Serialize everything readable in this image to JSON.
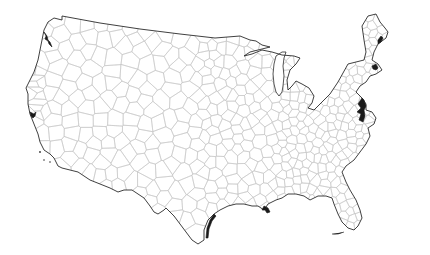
{
  "map": {
    "title": "Contiguous United States Voronoi tessellation",
    "colors": {
      "background": "#ffffff",
      "land": "#ffffff",
      "cell_edge": "#c4c4c4",
      "outline": "#2a2a2a"
    },
    "outline": [
      [
        54,
        18
      ],
      [
        62,
        20
      ],
      [
        62,
        16
      ],
      [
        100,
        23
      ],
      [
        140,
        29
      ],
      [
        180,
        34
      ],
      [
        215,
        38
      ],
      [
        240,
        36
      ],
      [
        250,
        40
      ],
      [
        256,
        41
      ],
      [
        262,
        45
      ],
      [
        270,
        47
      ],
      [
        250,
        52
      ],
      [
        244,
        56
      ],
      [
        252,
        54
      ],
      [
        262,
        50
      ],
      [
        272,
        52
      ],
      [
        282,
        55
      ],
      [
        294,
        56
      ],
      [
        300,
        58
      ],
      [
        296,
        64
      ],
      [
        290,
        70
      ],
      [
        287,
        80
      ],
      [
        288,
        90
      ],
      [
        292,
        86
      ],
      [
        296,
        81
      ],
      [
        302,
        84
      ],
      [
        309,
        88
      ],
      [
        314,
        96
      ],
      [
        312,
        103
      ],
      [
        308,
        108
      ],
      [
        314,
        110
      ],
      [
        320,
        104
      ],
      [
        330,
        94
      ],
      [
        338,
        82
      ],
      [
        348,
        64
      ],
      [
        356,
        62
      ],
      [
        364,
        60
      ],
      [
        366,
        52
      ],
      [
        364,
        40
      ],
      [
        362,
        26
      ],
      [
        368,
        16
      ],
      [
        376,
        14
      ],
      [
        380,
        22
      ],
      [
        385,
        28
      ],
      [
        388,
        32
      ],
      [
        386,
        38
      ],
      [
        378,
        44
      ],
      [
        374,
        52
      ],
      [
        372,
        60
      ],
      [
        378,
        64
      ],
      [
        382,
        70
      ],
      [
        376,
        74
      ],
      [
        370,
        76
      ],
      [
        366,
        82
      ],
      [
        360,
        86
      ],
      [
        356,
        92
      ],
      [
        362,
        98
      ],
      [
        366,
        104
      ],
      [
        366,
        110
      ],
      [
        372,
        112
      ],
      [
        376,
        118
      ],
      [
        374,
        124
      ],
      [
        368,
        128
      ],
      [
        370,
        136
      ],
      [
        366,
        144
      ],
      [
        360,
        152
      ],
      [
        354,
        160
      ],
      [
        346,
        166
      ],
      [
        342,
        172
      ],
      [
        346,
        182
      ],
      [
        350,
        190
      ],
      [
        356,
        200
      ],
      [
        360,
        210
      ],
      [
        362,
        218
      ],
      [
        358,
        226
      ],
      [
        354,
        230
      ],
      [
        348,
        228
      ],
      [
        342,
        222
      ],
      [
        338,
        214
      ],
      [
        334,
        204
      ],
      [
        332,
        198
      ],
      [
        326,
        196
      ],
      [
        318,
        196
      ],
      [
        310,
        200
      ],
      [
        304,
        196
      ],
      [
        296,
        194
      ],
      [
        288,
        194
      ],
      [
        282,
        198
      ],
      [
        276,
        200
      ],
      [
        268,
        204
      ],
      [
        264,
        210
      ],
      [
        258,
        206
      ],
      [
        252,
        206
      ],
      [
        244,
        204
      ],
      [
        236,
        204
      ],
      [
        228,
        206
      ],
      [
        220,
        210
      ],
      [
        214,
        214
      ],
      [
        208,
        220
      ],
      [
        204,
        230
      ],
      [
        204,
        240
      ],
      [
        198,
        244
      ],
      [
        192,
        240
      ],
      [
        186,
        232
      ],
      [
        180,
        224
      ],
      [
        174,
        216
      ],
      [
        170,
        212
      ],
      [
        166,
        208
      ],
      [
        164,
        210
      ],
      [
        158,
        214
      ],
      [
        154,
        212
      ],
      [
        150,
        206
      ],
      [
        144,
        198
      ],
      [
        138,
        194
      ],
      [
        132,
        190
      ],
      [
        124,
        190
      ],
      [
        118,
        192
      ],
      [
        110,
        188
      ],
      [
        100,
        184
      ],
      [
        90,
        180
      ],
      [
        78,
        172
      ],
      [
        70,
        170
      ],
      [
        62,
        168
      ],
      [
        58,
        166
      ],
      [
        54,
        158
      ],
      [
        50,
        154
      ],
      [
        44,
        150
      ],
      [
        42,
        146
      ],
      [
        40,
        142
      ],
      [
        38,
        134
      ],
      [
        34,
        124
      ],
      [
        30,
        114
      ],
      [
        28,
        104
      ],
      [
        28,
        94
      ],
      [
        26,
        88
      ],
      [
        30,
        80
      ],
      [
        34,
        72
      ],
      [
        38,
        60
      ],
      [
        40,
        50
      ],
      [
        42,
        40
      ],
      [
        44,
        30
      ],
      [
        48,
        22
      ]
    ],
    "lakes": [
      {
        "name": "lake-michigan",
        "points": [
          [
            276,
            56
          ],
          [
            282,
            52
          ],
          [
            286,
            52
          ],
          [
            284,
            58
          ],
          [
            283,
            66
          ],
          [
            284,
            76
          ],
          [
            283,
            86
          ],
          [
            282,
            92
          ],
          [
            279,
            96
          ],
          [
            276,
            92
          ],
          [
            274,
            84
          ],
          [
            273,
            74
          ],
          [
            274,
            64
          ]
        ]
      }
    ],
    "seed_count": 520,
    "seed_rng": 7,
    "density_regions": [
      {
        "x0": 30,
        "x1": 200,
        "y0": 18,
        "y1": 250,
        "weight": 0.32
      },
      {
        "x0": 200,
        "x1": 280,
        "y0": 35,
        "y1": 215,
        "weight": 0.28
      },
      {
        "x0": 280,
        "x1": 390,
        "y0": 15,
        "y1": 235,
        "weight": 0.4
      }
    ]
  }
}
